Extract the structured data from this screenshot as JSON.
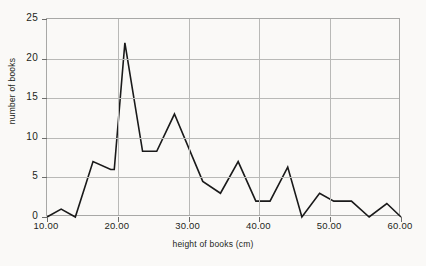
{
  "chart_data": {
    "type": "line",
    "title": "",
    "xlabel": "height of books (cm)",
    "ylabel": "number of books",
    "xlim": [
      10,
      60
    ],
    "ylim": [
      0,
      25
    ],
    "grid": true,
    "legend": false,
    "xticks": [
      "10.00",
      "20.00",
      "30.00",
      "40.00",
      "50.00",
      "60.00"
    ],
    "xtick_values": [
      10,
      20,
      30,
      40,
      50,
      60
    ],
    "yticks": [
      "0",
      "5",
      "10",
      "15",
      "20",
      "25"
    ],
    "ytick_values": [
      0,
      5,
      10,
      15,
      20,
      25
    ],
    "x": [
      10,
      12,
      14,
      16.5,
      19,
      19.5,
      21,
      23.5,
      25.5,
      28,
      32,
      34.5,
      37,
      39.5,
      41.5,
      44,
      46,
      48.5,
      50.5,
      53,
      55.5,
      58,
      60
    ],
    "values": [
      0,
      1,
      0,
      7,
      6,
      6,
      22,
      8.3,
      8.3,
      13,
      4.5,
      3,
      7,
      2,
      2,
      6.3,
      0,
      3,
      2,
      2,
      0,
      1.7,
      0
    ],
    "series_name": "number of books",
    "line_color": "#1a1a1a",
    "grid_color": "#b9b9b7",
    "axis_color": "#a8a8a6",
    "background_color": "#faf9f7"
  }
}
